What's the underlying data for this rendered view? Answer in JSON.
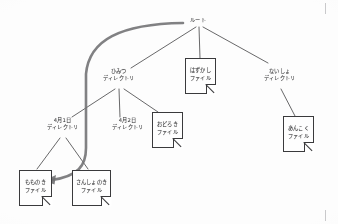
{
  "diagram": {
    "kind": "directory-tree",
    "ink_color": "#2e2e33",
    "line_color": "#3a3a40",
    "highlight_arrow_color": "#6f6f77",
    "background": "#fdfdfd",
    "nodes": [
      {
        "id": "root",
        "type": "directory",
        "line1": "ルート",
        "line2": "",
        "x": 198,
        "y": 22
      },
      {
        "id": "himitsu",
        "type": "directory",
        "line1": "ひみつ",
        "line2": "ディレクトリ",
        "x": 118,
        "y": 75
      },
      {
        "id": "naisho",
        "type": "directory",
        "line1": "ないしょ",
        "line2": "ディレクトリ",
        "x": 279,
        "y": 75
      },
      {
        "id": "april1",
        "type": "directory",
        "line1": "4月1日",
        "line2": "ディレクトリ",
        "x": 62,
        "y": 124
      },
      {
        "id": "april2",
        "type": "directory",
        "line1": "4月2日",
        "line2": "ディレクトリ",
        "x": 127,
        "y": 124
      },
      {
        "id": "hazukashi",
        "type": "file",
        "line1": "はずかし",
        "line2": "ファイル",
        "x": 185,
        "y": 59
      },
      {
        "id": "odoroki",
        "type": "file",
        "line1": "おどろき",
        "line2": "ファイル",
        "x": 152,
        "y": 113
      },
      {
        "id": "ankoku",
        "type": "file",
        "line1": "あんこく",
        "line2": "ファイル",
        "x": 283,
        "y": 117
      },
      {
        "id": "momonoki",
        "type": "file",
        "line1": "もものき",
        "line2": "ファイル",
        "x": 19,
        "y": 172
      },
      {
        "id": "sanshonoki",
        "type": "file",
        "line1": "さんしょのき",
        "line2": "ファイル",
        "x": 72,
        "y": 172
      }
    ],
    "edges": [
      {
        "from": "root",
        "to": "himitsu"
      },
      {
        "from": "root",
        "to": "hazukashi"
      },
      {
        "from": "root",
        "to": "naisho"
      },
      {
        "from": "himitsu",
        "to": "april1"
      },
      {
        "from": "himitsu",
        "to": "april2"
      },
      {
        "from": "himitsu",
        "to": "odoroki"
      },
      {
        "from": "naisho",
        "to": "ankoku"
      },
      {
        "from": "april1",
        "to": "momonoki"
      },
      {
        "from": "april1",
        "to": "sanshonoki"
      }
    ],
    "path_arrow": {
      "from": "root",
      "to": "momonoki",
      "style": "thick-curved-with-arrowhead"
    }
  }
}
